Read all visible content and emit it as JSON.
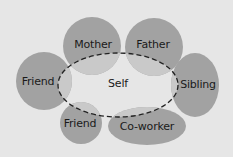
{
  "diagram": {
    "colors": {
      "background": "#e6e6e6",
      "node_fill": "#a2a2a2",
      "overlap_fill": "#c9c9c9",
      "self_outline": "#222222"
    },
    "self": {
      "label": "Self",
      "cx": 118,
      "cy": 85,
      "rx": 60,
      "ry": 32
    },
    "nodes": [
      {
        "id": "mother",
        "label": "Mother",
        "shape": "circle",
        "cx": 92,
        "cy": 46,
        "rx": 29,
        "ry": 29,
        "lx": 93,
        "ly": 44
      },
      {
        "id": "father",
        "label": "Father",
        "shape": "circle",
        "cx": 154,
        "cy": 47,
        "rx": 29,
        "ry": 29,
        "lx": 153,
        "ly": 44
      },
      {
        "id": "friend-left",
        "label": "Friend",
        "shape": "circle",
        "cx": 44,
        "cy": 81,
        "rx": 28,
        "ry": 29,
        "lx": 38,
        "ly": 81
      },
      {
        "id": "sibling",
        "label": "Sibling",
        "shape": "ellipse",
        "cx": 195,
        "cy": 85,
        "rx": 24,
        "ry": 32,
        "lx": 198,
        "ly": 84
      },
      {
        "id": "friend-bottom",
        "label": "Friend",
        "shape": "circle",
        "cx": 81,
        "cy": 123,
        "rx": 21,
        "ry": 21,
        "lx": 80,
        "ly": 123
      },
      {
        "id": "coworker",
        "label": "Co-worker",
        "shape": "ellipse",
        "cx": 147,
        "cy": 126,
        "rx": 39,
        "ry": 19,
        "lx": 147,
        "ly": 126
      }
    ]
  }
}
